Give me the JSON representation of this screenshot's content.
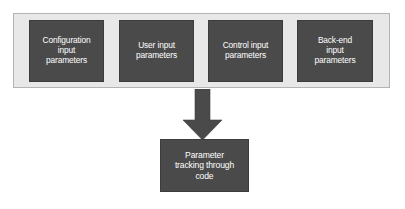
{
  "diagram": {
    "type": "flow-diagram",
    "background_color": "#ffffff",
    "container": {
      "name": "input-parameters-group",
      "fill_color": "#e8e8e8",
      "border_color": "#b4b4b4"
    },
    "node_fill_color": "#4a4a4a",
    "node_text_color": "#ffffff",
    "arrow_color": "#4a4a4a",
    "input_nodes": [
      {
        "id": "configuration-input-parameters",
        "label": "Configuration\ninput\nparameters"
      },
      {
        "id": "user-input-parameters",
        "label": "User input\nparameters"
      },
      {
        "id": "control-input-parameters",
        "label": "Control input\nparameters"
      },
      {
        "id": "back-end-input-parameters",
        "label": "Back-end\ninput\nparameters"
      }
    ],
    "arrow": {
      "id": "downward-arrow",
      "direction": "down",
      "from": "input-parameters-group",
      "to": "parameter-tracking-through-code"
    },
    "outcome_node": {
      "id": "parameter-tracking-through-code",
      "label": "Parameter\ntracking through\ncode"
    }
  }
}
